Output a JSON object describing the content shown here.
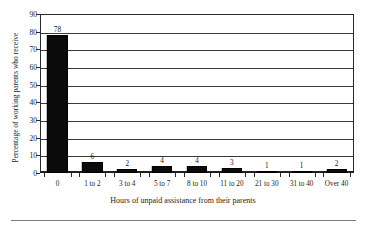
{
  "chart_data": {
    "type": "bar",
    "title": "",
    "xlabel": "Hours of unpaid assistance from their parents",
    "ylabel": "Percentage of working parents who receive",
    "categories": [
      "0",
      "1 to 2",
      "3 to 4",
      "5 to 7",
      "8 to 10",
      "11 to 20",
      "21 to 30",
      "31 to 40",
      "Over 40"
    ],
    "values": [
      78,
      6,
      2,
      4,
      4,
      3,
      1,
      1,
      2
    ],
    "value_labels": [
      "78",
      "6",
      "2",
      "4",
      "4",
      "3",
      "1",
      "1",
      "2"
    ],
    "ylim": [
      0,
      90
    ],
    "ytick_labels": [
      "0",
      "10",
      "20",
      "30",
      "40",
      "50",
      "60",
      "70",
      "80",
      "90"
    ],
    "ytick_values": [
      0,
      10,
      20,
      30,
      40,
      50,
      60,
      70,
      80,
      90
    ],
    "grid": "horizontal",
    "legend": "none",
    "bar_color": "#0b0b0b",
    "axis_color": "#2a2a2a"
  }
}
